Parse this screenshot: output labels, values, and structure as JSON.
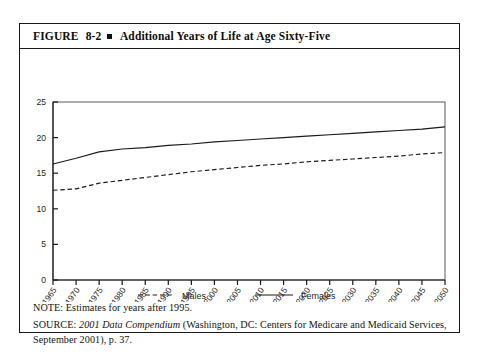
{
  "figure": {
    "label": "FIGURE",
    "number": "8-2",
    "title": "Additional Years of Life at Age Sixty-Five"
  },
  "notes": {
    "note_prefix": "NOTE:",
    "note_text": " Estimates for years after 1995.",
    "source_prefix": "SOURCE:",
    "source_italic": "2001 Data Compendium",
    "source_rest": " (Washington, DC: Centers for Medicare and Medicaid Services, September 2001), p. 37."
  },
  "chart_data": {
    "type": "line",
    "title": "Additional Years of Life at Age Sixty-Five",
    "xlabel": "",
    "ylabel": "",
    "xlim": [
      1965,
      2050
    ],
    "ylim": [
      0,
      25
    ],
    "grid": false,
    "legend_position": "bottom",
    "categories": [
      "1965",
      "1970",
      "1975",
      "1980",
      "1985",
      "1990",
      "1995",
      "2000",
      "2005",
      "2010",
      "2015",
      "2020",
      "2025",
      "2030",
      "2035",
      "2040",
      "2045",
      "2050"
    ],
    "yticks": [
      0,
      5,
      10,
      15,
      20,
      25
    ],
    "series": [
      {
        "name": "Males",
        "style": "dashed",
        "color": "#1a1a1a",
        "values": [
          12.6,
          12.8,
          13.6,
          14.0,
          14.4,
          14.8,
          15.2,
          15.5,
          15.8,
          16.1,
          16.3,
          16.6,
          16.8,
          17.0,
          17.2,
          17.4,
          17.7,
          17.9
        ]
      },
      {
        "name": "Females",
        "style": "solid",
        "color": "#1a1a1a",
        "values": [
          16.3,
          17.1,
          18.0,
          18.4,
          18.6,
          18.9,
          19.1,
          19.4,
          19.6,
          19.8,
          20.0,
          20.2,
          20.4,
          20.6,
          20.8,
          21.0,
          21.2,
          21.5
        ]
      }
    ]
  }
}
